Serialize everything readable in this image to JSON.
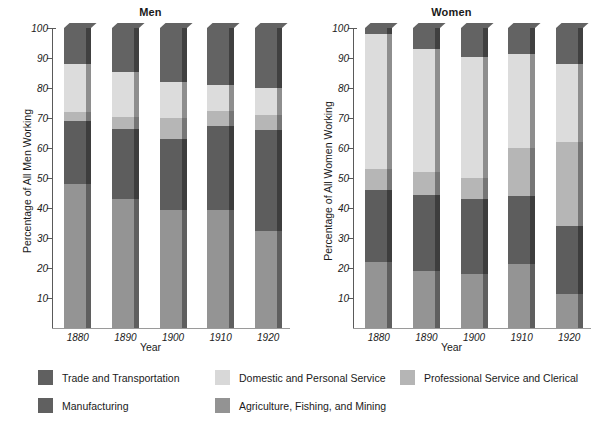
{
  "chart_data": {
    "type": "bar",
    "subtype": "stacked-percentage",
    "title": "",
    "panels": [
      {
        "title": "Men",
        "xlabel": "Year",
        "ylabel": "Percentage of All Men Working",
        "categories": [
          "1880",
          "1890",
          "1900",
          "1910",
          "1920"
        ],
        "ylim": [
          0,
          100
        ],
        "yticks": [
          10,
          20,
          30,
          40,
          50,
          60,
          70,
          80,
          90,
          100
        ],
        "series": [
          {
            "name": "Agriculture, Fishing, and Mining",
            "values": [
              48,
              43,
              39.5,
              39.5,
              32.5
            ]
          },
          {
            "name": "Manufacturing",
            "values": [
              21,
              23.5,
              23.5,
              28,
              33.5
            ]
          },
          {
            "name": "Professional Service and Clerical",
            "values": [
              3,
              4,
              7,
              5,
              5
            ]
          },
          {
            "name": "Domestic and Personal Service",
            "values": [
              16,
              15,
              12,
              8.5,
              9
            ]
          },
          {
            "name": "Trade and Transportation",
            "values": [
              12,
              14.5,
              18,
              19,
              20
            ]
          }
        ]
      },
      {
        "title": "Women",
        "xlabel": "Year",
        "ylabel": "Percentage of All Women Working",
        "categories": [
          "1880",
          "1890",
          "1900",
          "1910",
          "1920"
        ],
        "ylim": [
          0,
          100
        ],
        "yticks": [
          10,
          20,
          30,
          40,
          50,
          60,
          70,
          80,
          90,
          100
        ],
        "series": [
          {
            "name": "Agriculture, Fishing, and Mining",
            "values": [
              22,
              19,
              18,
              21.5,
              11.5
            ]
          },
          {
            "name": "Manufacturing",
            "values": [
              24,
              25.5,
              25,
              22.5,
              22.5
            ]
          },
          {
            "name": "Professional Service and Clerical",
            "values": [
              7,
              7.5,
              7,
              16,
              28
            ]
          },
          {
            "name": "Domestic and Personal Service",
            "values": [
              45,
              41,
              40.5,
              31.5,
              26
            ]
          },
          {
            "name": "Trade and Transportation",
            "values": [
              2,
              7,
              9.5,
              8.5,
              12
            ]
          }
        ]
      }
    ],
    "legend": {
      "position": "bottom",
      "entries": [
        {
          "label": "Trade and Transportation",
          "color": "#606060"
        },
        {
          "label": "Domestic and Personal Service",
          "color": "#d8d8d8"
        },
        {
          "label": "Professional Service and Clerical",
          "color": "#b5b5b5"
        },
        {
          "label": "Manufacturing",
          "color": "#606060"
        },
        {
          "label": "Agriculture, Fishing, and Mining",
          "color": "#939393"
        }
      ]
    },
    "colors": {
      "trade": "#636363",
      "domestic": "#dcdcdc",
      "professional": "#b6b6b6",
      "manufacturing": "#5d5d5d",
      "agriculture": "#949494",
      "side_face": "#4a4a4a",
      "axis": "#5a5a5a"
    },
    "grid": false
  }
}
